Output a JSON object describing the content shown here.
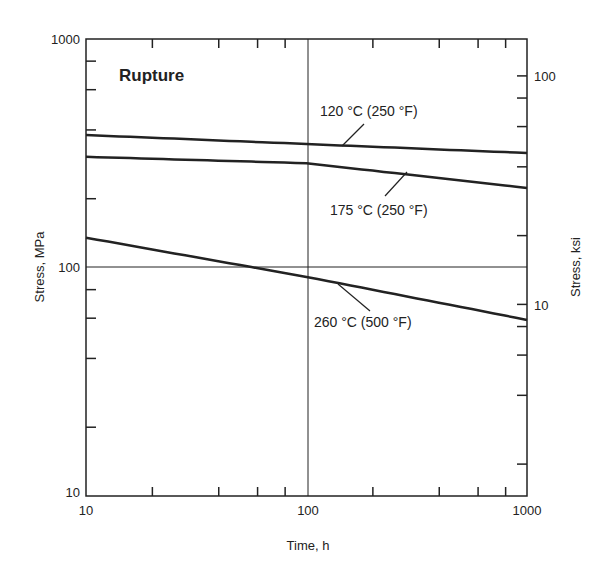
{
  "chart_data": {
    "type": "line",
    "title": "Rupture",
    "xlabel": "Time, h",
    "ylabel": "Stress, MPa",
    "ylabel_right": "Stress, ksi",
    "xscale": "log",
    "yscale": "log",
    "xlim": [
      10,
      1000
    ],
    "ylim": [
      10,
      1000
    ],
    "ylim_right_ksi": [
      1.45,
      145
    ],
    "x_tick_labels": [
      "10",
      "100",
      "1000"
    ],
    "y_tick_labels": [
      "10",
      "100",
      "1000"
    ],
    "y_right_tick_labels": [
      "10",
      "100"
    ],
    "grid": "crosshair lines at x=100 and y=100",
    "x": [
      10,
      100,
      1000
    ],
    "series": [
      {
        "name": "120 °C (250 °F)",
        "values": [
          380,
          347,
          317
        ]
      },
      {
        "name": "175 °C (250 °F)",
        "values": [
          305,
          286,
          223
        ]
      },
      {
        "name": "260 °C (500 °F)",
        "values": [
          135,
          91,
          59
        ]
      }
    ]
  },
  "labels": {
    "title": "Rupture",
    "xlabel": "Time, h",
    "ylabel": "Stress, MPa",
    "ylabel_right": "Stress, ksi",
    "x10": "10",
    "x100": "100",
    "x1000": "1000",
    "y10": "10",
    "y100": "100",
    "y1000": "1000",
    "r10": "10",
    "r100": "100",
    "s1": "120 °C (250 °F)",
    "s2": "175 °C (250 °F)",
    "s3": "260 °C (500 °F)"
  }
}
